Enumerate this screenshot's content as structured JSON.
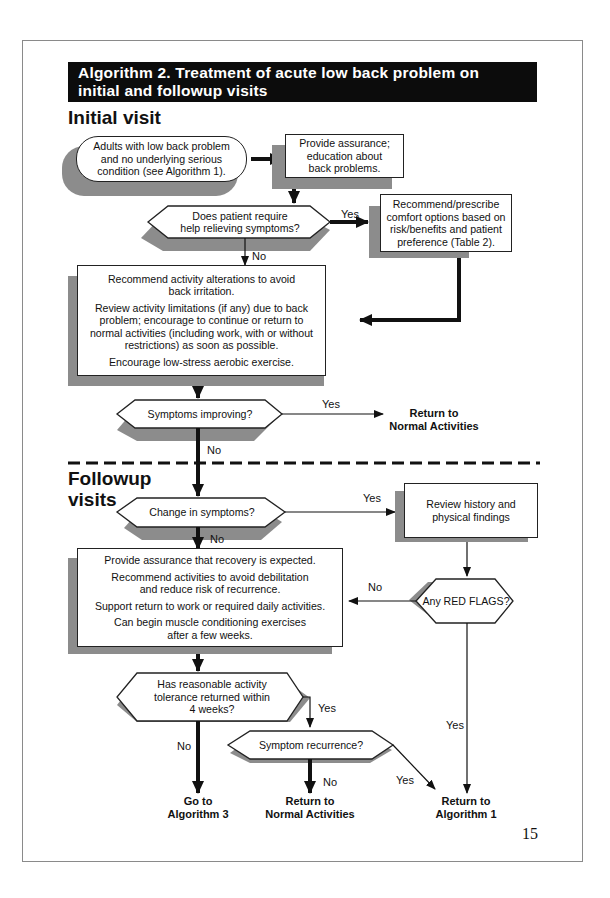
{
  "title": {
    "line1": "Algorithm 2.  Treatment of acute low back problem on",
    "line2": "initial and followup visits"
  },
  "sections": {
    "initial": "Initial visit",
    "followup_line1": "Followup",
    "followup_line2": "visits"
  },
  "nodes": {
    "start": [
      "Adults with low back problem",
      "and no underlying serious",
      "condition (see Algorithm 1)."
    ],
    "assurance": [
      "Provide assurance;",
      "education about",
      "back problems."
    ],
    "q_help": [
      "Does patient require",
      "help relieving symptoms?"
    ],
    "comfort": [
      "Recommend/prescribe",
      "comfort options based on",
      "risk/benefits and patient",
      "preference (Table 2)."
    ],
    "activity": {
      "p1": "Recommend activity alterations to avoid back irritation.",
      "p2": "Review activity limitations (if any) due to back problem; encourage to continue or return to normal activities (including work, with or without restrictions) as soon as possible.",
      "p3": "Encourage low-stress aerobic exercise."
    },
    "q_improving": "Symptoms improving?",
    "t_normal_1": [
      "Return to",
      "Normal Activities"
    ],
    "q_change": "Change in symptoms?",
    "review": [
      "Review history and",
      "physical findings"
    ],
    "q_redflags": "Any RED FLAGS?",
    "followup_box": {
      "p1": "Provide assurance that recovery is expected.",
      "p2": "Recommend activities to avoid debilitation and reduce risk of recurrence.",
      "p3": "Support return to work or required daily activities.",
      "p4": "Can begin muscle conditioning exercises after a few weeks."
    },
    "q_tolerance": [
      "Has reasonable activity",
      "tolerance returned within",
      "4 weeks?"
    ],
    "q_recurrence": "Symptom recurrence?",
    "t_alg3": [
      "Go to",
      "Algorithm 3"
    ],
    "t_normal_2": [
      "Return to",
      "Normal Activities"
    ],
    "t_alg1": [
      "Return to",
      "Algorithm 1"
    ]
  },
  "edge_labels": {
    "help_yes": "Yes",
    "help_no": "No",
    "improving_yes": "Yes",
    "improving_no": "No",
    "change_yes": "Yes",
    "change_no": "No",
    "redflags_no": "No",
    "redflags_yes": "Yes",
    "tolerance_yes": "Yes",
    "tolerance_no": "No",
    "recurrence_no": "No",
    "recurrence_yes": "Yes"
  },
  "page_number": "15"
}
